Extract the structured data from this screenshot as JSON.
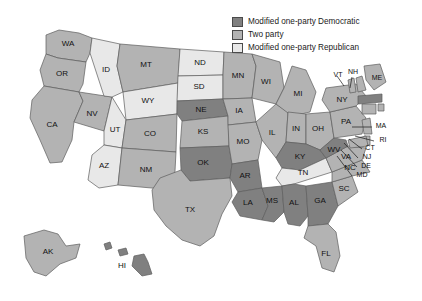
{
  "figure": {
    "type": "choropleth-map",
    "region": "United States",
    "title": ""
  },
  "colors": {
    "dark": "#808080",
    "medium": "#b3b3b3",
    "light": "#e8e8e8",
    "border": "#5d5d5d",
    "background": "#ffffff",
    "text": "#111111"
  },
  "legend": {
    "position": "top-right",
    "items": [
      {
        "label": "Modified one-party Democratic",
        "swatch": "dark",
        "color": "#808080"
      },
      {
        "label": "Two party",
        "swatch": "medium",
        "color": "#b3b3b3"
      },
      {
        "label": "Modified one-party Republican",
        "swatch": "light",
        "color": "#e8e8e8"
      }
    ]
  },
  "chart_data": {
    "type": "map",
    "categories": [
      "Modified one-party Democratic",
      "Two party",
      "Modified one-party Republican"
    ],
    "title": "",
    "states": [
      {
        "code": "WA",
        "category": "Two party"
      },
      {
        "code": "OR",
        "category": "Two party"
      },
      {
        "code": "CA",
        "category": "Two party"
      },
      {
        "code": "NV",
        "category": "Two party"
      },
      {
        "code": "ID",
        "category": "Modified one-party Republican"
      },
      {
        "code": "MT",
        "category": "Two party"
      },
      {
        "code": "WY",
        "category": "Modified one-party Republican"
      },
      {
        "code": "UT",
        "category": "Modified one-party Republican"
      },
      {
        "code": "AZ",
        "category": "Modified one-party Republican"
      },
      {
        "code": "CO",
        "category": "Two party"
      },
      {
        "code": "NM",
        "category": "Two party"
      },
      {
        "code": "ND",
        "category": "Modified one-party Republican"
      },
      {
        "code": "SD",
        "category": "Modified one-party Republican"
      },
      {
        "code": "NE",
        "category": "Modified one-party Democratic"
      },
      {
        "code": "KS",
        "category": "Two party"
      },
      {
        "code": "OK",
        "category": "Modified one-party Democratic"
      },
      {
        "code": "TX",
        "category": "Two party"
      },
      {
        "code": "MN",
        "category": "Two party"
      },
      {
        "code": "IA",
        "category": "Two party"
      },
      {
        "code": "MO",
        "category": "Two party"
      },
      {
        "code": "AR",
        "category": "Modified one-party Democratic"
      },
      {
        "code": "LA",
        "category": "Modified one-party Democratic"
      },
      {
        "code": "WI",
        "category": "Two party"
      },
      {
        "code": "IL",
        "category": "Two party"
      },
      {
        "code": "MS",
        "category": "Modified one-party Democratic"
      },
      {
        "code": "MI",
        "category": "Two party"
      },
      {
        "code": "IN",
        "category": "Two party"
      },
      {
        "code": "OH",
        "category": "Two party"
      },
      {
        "code": "KY",
        "category": "Modified one-party Democratic"
      },
      {
        "code": "TN",
        "category": "Modified one-party Republican"
      },
      {
        "code": "AL",
        "category": "Modified one-party Democratic"
      },
      {
        "code": "GA",
        "category": "Modified one-party Democratic"
      },
      {
        "code": "FL",
        "category": "Two party"
      },
      {
        "code": "SC",
        "category": "Two party"
      },
      {
        "code": "NC",
        "category": "Two party"
      },
      {
        "code": "VA",
        "category": "Two party"
      },
      {
        "code": "WV",
        "category": "Modified one-party Democratic"
      },
      {
        "code": "MD",
        "category": "Two party"
      },
      {
        "code": "DE",
        "category": "Two party"
      },
      {
        "code": "NJ",
        "category": "Two party"
      },
      {
        "code": "PA",
        "category": "Two party"
      },
      {
        "code": "NY",
        "category": "Two party"
      },
      {
        "code": "CT",
        "category": "Two party"
      },
      {
        "code": "RI",
        "category": "Two party"
      },
      {
        "code": "MA",
        "category": "Modified one-party Democratic"
      },
      {
        "code": "VT",
        "category": "Two party"
      },
      {
        "code": "NH",
        "category": "Two party"
      },
      {
        "code": "ME",
        "category": "Two party"
      },
      {
        "code": "AK",
        "category": "Two party"
      },
      {
        "code": "HI",
        "category": "Modified one-party Democratic"
      }
    ]
  },
  "labels": {
    "WA": "WA",
    "OR": "OR",
    "CA": "CA",
    "NV": "NV",
    "ID": "ID",
    "MT": "MT",
    "WY": "WY",
    "UT": "UT",
    "AZ": "AZ",
    "CO": "CO",
    "NM": "NM",
    "ND": "ND",
    "SD": "SD",
    "NE": "NE",
    "KS": "KS",
    "OK": "OK",
    "TX": "TX",
    "MN": "MN",
    "IA": "IA",
    "MO": "MO",
    "AR": "AR",
    "LA": "LA",
    "WI": "WI",
    "IL": "IL",
    "MS": "MS",
    "MI": "MI",
    "IN": "IN",
    "OH": "OH",
    "KY": "KY",
    "TN": "TN",
    "AL": "AL",
    "GA": "GA",
    "FL": "FL",
    "SC": "SC",
    "NC": "NC",
    "VA": "VA",
    "WV": "WV",
    "MD": "MD",
    "DE": "DE",
    "NJ": "NJ",
    "PA": "PA",
    "NY": "NY",
    "CT": "CT",
    "RI": "RI",
    "MA": "MA",
    "VT": "VT",
    "NH": "NH",
    "ME": "ME",
    "AK": "AK",
    "HI": "HI"
  }
}
